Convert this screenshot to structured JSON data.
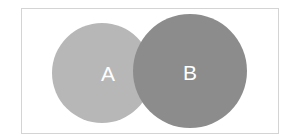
{
  "diagram": {
    "type": "venn",
    "sets": [
      {
        "label": "A",
        "fill": "#b5b5b5"
      },
      {
        "label": "B",
        "fill": "#8a8a8a"
      }
    ],
    "label_color": "#ffffff"
  }
}
